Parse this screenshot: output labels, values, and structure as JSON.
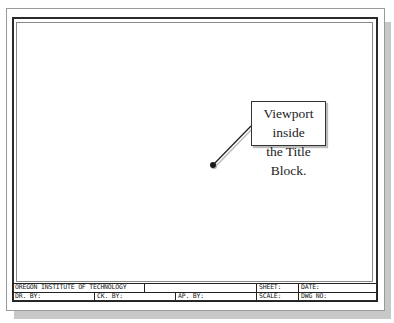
{
  "drawing": {
    "callout": {
      "line1": "Viewport inside",
      "line2": "the Title Block."
    },
    "title_block": {
      "row1": {
        "institution": "OREGON INSTITUTE OF TECHNOLOGY",
        "blank": "",
        "sheet_label": "SHEET:",
        "date_label": "DATE:"
      },
      "row2": {
        "drawn_by_label": "DR. BY:",
        "checked_by_label": "CK. BY:",
        "approved_by_label": "AP. BY:",
        "scale_label": "SCALE:",
        "dwg_no_label": "DWG NO:"
      }
    }
  }
}
